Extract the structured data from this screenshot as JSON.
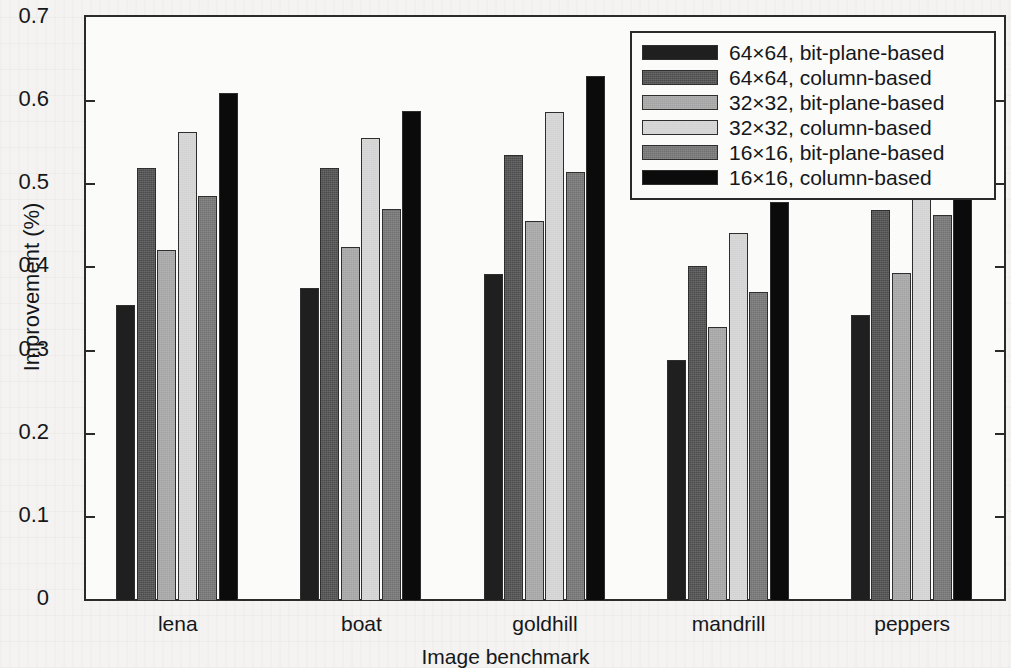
{
  "chart_data": {
    "type": "bar",
    "title": "",
    "xlabel": "Image benchmark",
    "ylabel": "Improvement (%)",
    "categories": [
      "lena",
      "boat",
      "goldhill",
      "mandrill",
      "peppers"
    ],
    "ylim": [
      0,
      0.7
    ],
    "ytick_labels": [
      "0",
      "0.1",
      "0.2",
      "0.3",
      "0.4",
      "0.5",
      "0.6",
      "0.7"
    ],
    "ytick_values": [
      0,
      0.1,
      0.2,
      0.3,
      0.4,
      0.5,
      0.6,
      0.7
    ],
    "grid": false,
    "legend_position": "top-right",
    "series": [
      {
        "name": "64×64, bit-plane-based",
        "color": "#1f1f1f",
        "values": [
          0.356,
          0.376,
          0.393,
          0.29,
          0.344
        ]
      },
      {
        "name": "64×64, column-based",
        "color": "#4b4b4b",
        "values": [
          0.521,
          0.521,
          0.536,
          0.403,
          0.47
        ]
      },
      {
        "name": "32×32, bit-plane-based",
        "color": "#a3a3a3",
        "values": [
          0.422,
          0.426,
          0.457,
          0.33,
          0.394
        ]
      },
      {
        "name": "32×32, column-based",
        "color": "#d2d2d2",
        "values": [
          0.564,
          0.557,
          0.588,
          0.443,
          0.526
        ]
      },
      {
        "name": "16×16, bit-plane-based",
        "color": "#717171",
        "values": [
          0.487,
          0.472,
          0.516,
          0.372,
          0.464
        ]
      },
      {
        "name": "16×16, column-based",
        "color": "#0b0b0b",
        "values": [
          0.611,
          0.589,
          0.632,
          0.48,
          0.585
        ]
      }
    ]
  },
  "axis": {
    "y_label": "Improvement (%)",
    "x_label": "Image benchmark"
  }
}
